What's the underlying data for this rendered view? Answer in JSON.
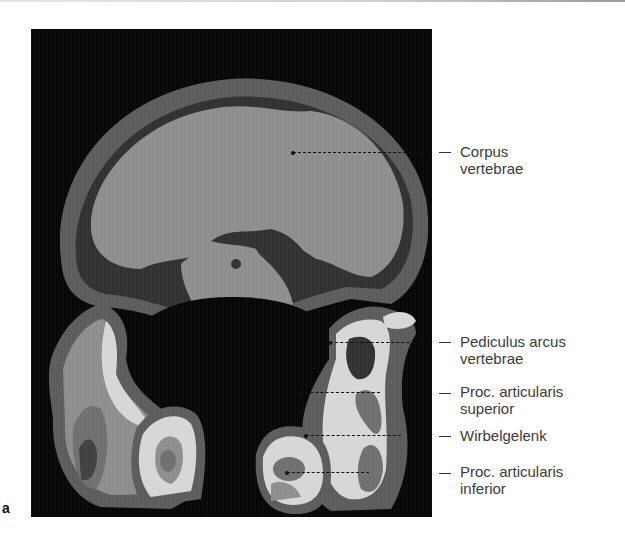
{
  "figure": {
    "panel_letter": "a",
    "image_description": "CT cross-section of a lumbar vertebra (density-coded grayscale)",
    "labels": [
      {
        "id": "corpus",
        "lines": [
          "Corpus",
          "vertebrae"
        ]
      },
      {
        "id": "pediculus",
        "lines": [
          "Pediculus arcus",
          "vertebrae"
        ]
      },
      {
        "id": "proc-sup",
        "lines": [
          "Proc. articularis",
          "superior"
        ]
      },
      {
        "id": "wirbelgelenk",
        "lines": [
          "Wirbelgelenk"
        ]
      },
      {
        "id": "proc-inf",
        "lines": [
          "Proc. articularis",
          "inferior"
        ]
      }
    ]
  },
  "colors": {
    "background": "#030303",
    "cortex_outer": "#5a5a5a",
    "soft_dark": "#2e2e2e",
    "cancellous": "#8c8c8c",
    "dense": "#d6d6d6",
    "mid": "#6e6e6e"
  }
}
